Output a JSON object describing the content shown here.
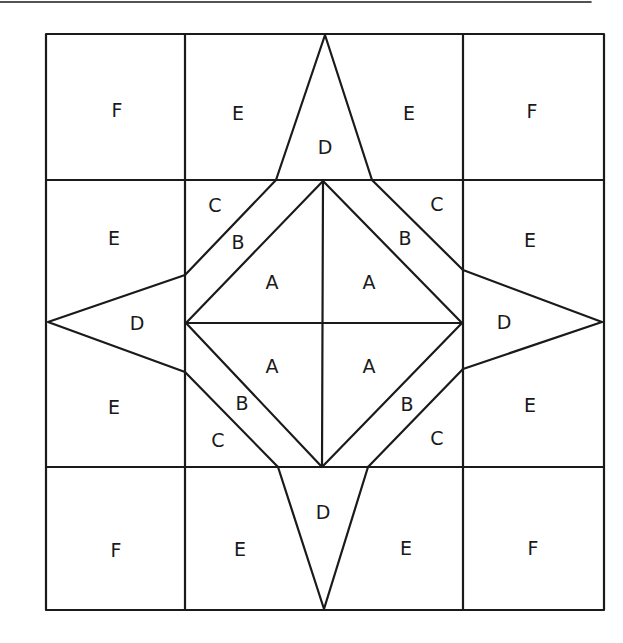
{
  "diagram": {
    "title": "",
    "type": "quilt-block-pattern",
    "grid": {
      "columns": 4,
      "rows": 4
    },
    "labels": {
      "F_tl": "F",
      "E_t1": "E",
      "D_top": "D",
      "E_t2": "E",
      "F_tr": "F",
      "C_ul": "C",
      "E_l1": "E",
      "B_ul": "B",
      "A_ul": "A",
      "A_ur": "A",
      "B_ur": "B",
      "C_ur": "C",
      "E_r1": "E",
      "D_left": "D",
      "D_right": "D",
      "E_l2": "E",
      "A_ll": "A",
      "A_lr": "A",
      "B_ll": "B",
      "B_lr": "B",
      "E_r2": "E",
      "C_ll": "C",
      "C_lr": "C",
      "D_bottom": "D",
      "F_bl": "F",
      "E_b1": "E",
      "E_b2": "E",
      "F_br": "F"
    },
    "pieces": [
      {
        "id": "A",
        "description": "center square quarter triangles",
        "count": 4
      },
      {
        "id": "B",
        "description": "diagonal strips around center square",
        "count": 4
      },
      {
        "id": "C",
        "description": "corner triangles of inner ring squares",
        "count": 4
      },
      {
        "id": "D",
        "description": "star point triangles",
        "count": 4
      },
      {
        "id": "E",
        "description": "edge background pieces",
        "count": 8
      },
      {
        "id": "F",
        "description": "corner squares",
        "count": 4
      }
    ]
  }
}
